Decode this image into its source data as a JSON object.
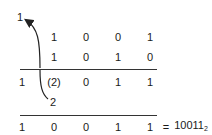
{
  "carry_top": "1",
  "rows": [
    {
      "cells": [
        "",
        "1",
        "0",
        "0",
        "1"
      ]
    },
    {
      "cells": [
        "",
        "1",
        "0",
        "1",
        "0"
      ]
    },
    {
      "cells": [
        "1",
        "(2)",
        "0",
        "1",
        "1"
      ]
    },
    {
      "cells": [
        "",
        "2",
        "",
        "",
        ""
      ]
    },
    {
      "cells": [
        "1",
        "0",
        "0",
        "1",
        "1"
      ]
    }
  ],
  "result": {
    "equals": "=",
    "value": "10011",
    "base": "2"
  }
}
